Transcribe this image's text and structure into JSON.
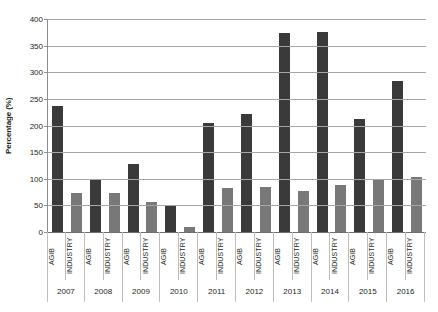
{
  "chart_data": {
    "type": "bar",
    "title": "",
    "subtitle": "",
    "xlabel": "",
    "ylabel": "Percentage (%)",
    "ylim": [
      0,
      400
    ],
    "ytick_step": 50,
    "yticks": [
      "400",
      "350",
      "300",
      "250",
      "200",
      "150",
      "100",
      "50",
      "0"
    ],
    "grid": true,
    "legend": "none",
    "categories": [
      "2007",
      "2008",
      "2009",
      "2010",
      "2011",
      "2012",
      "2013",
      "2014",
      "2015",
      "2016"
    ],
    "subcategories": [
      "AGIB",
      "INDUSTRY"
    ],
    "series": [
      {
        "name": "AGIB",
        "color": "#3a3a3a",
        "values": [
          237,
          97,
          127,
          48,
          204,
          221,
          373,
          376,
          213,
          283
        ]
      },
      {
        "name": "INDUSTRY",
        "color": "#787878",
        "values": [
          73,
          74,
          57,
          10,
          82,
          84,
          77,
          88,
          97,
          103
        ]
      }
    ],
    "bars": [
      {
        "group": "2007",
        "label": "AGIB",
        "value": 237,
        "series": "AGIB"
      },
      {
        "group": "2007",
        "label": "INDUSTRY",
        "value": 73,
        "series": "INDUSTRY"
      },
      {
        "group": "2008",
        "label": "AGIB",
        "value": 97,
        "series": "AGIB"
      },
      {
        "group": "2008",
        "label": "INDUSTRY",
        "value": 74,
        "series": "INDUSTRY"
      },
      {
        "group": "2009",
        "label": "AGIB",
        "value": 127,
        "series": "AGIB"
      },
      {
        "group": "2009",
        "label": "INDUSTRY",
        "value": 57,
        "series": "INDUSTRY"
      },
      {
        "group": "2010",
        "label": "AGIB",
        "value": 48,
        "series": "AGIB"
      },
      {
        "group": "2010",
        "label": "INDUSTRY",
        "value": 10,
        "series": "INDUSTRY"
      },
      {
        "group": "2011",
        "label": "AGIB",
        "value": 204,
        "series": "AGIB"
      },
      {
        "group": "2011",
        "label": "INDUSTRY",
        "value": 82,
        "series": "INDUSTRY"
      },
      {
        "group": "2012",
        "label": "AGIB",
        "value": 221,
        "series": "AGIB"
      },
      {
        "group": "2012",
        "label": "INDUSTRY",
        "value": 84,
        "series": "INDUSTRY"
      },
      {
        "group": "2013",
        "label": "AGIB",
        "value": 373,
        "series": "AGIB"
      },
      {
        "group": "2013",
        "label": "INDUSTRY",
        "value": 77,
        "series": "INDUSTRY"
      },
      {
        "group": "2014",
        "label": "AGIB",
        "value": 376,
        "series": "AGIB"
      },
      {
        "group": "2014",
        "label": "INDUSTRY",
        "value": 88,
        "series": "INDUSTRY"
      },
      {
        "group": "2015",
        "label": "AGIB",
        "value": 213,
        "series": "AGIB"
      },
      {
        "group": "2015",
        "label": "INDUSTRY",
        "value": 97,
        "series": "INDUSTRY"
      },
      {
        "group": "2016",
        "label": "AGIB",
        "value": 283,
        "series": "AGIB"
      },
      {
        "group": "2016",
        "label": "INDUSTRY",
        "value": 103,
        "series": "INDUSTRY"
      }
    ],
    "colors": {
      "agib": "#3a3a3a",
      "industry": "#787878",
      "gridline": "#a6a6a6",
      "axis": "#8d8d8d",
      "text": "#231f20",
      "background": "#ffffff"
    }
  }
}
